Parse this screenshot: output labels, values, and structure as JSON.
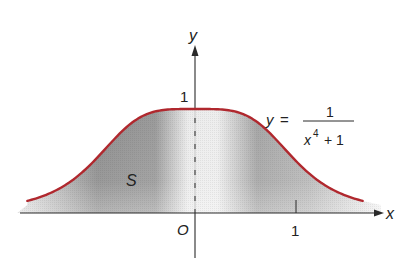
{
  "figure": {
    "type": "function-graph",
    "function": {
      "lhs": "y",
      "equals": "=",
      "numerator": "1",
      "denominator_base": "x",
      "denominator_exponent": "4",
      "denominator_rest": "+ 1",
      "curve_color": "#b0282e"
    },
    "region_label": "S",
    "axes": {
      "x_label": "x",
      "y_label": "y",
      "origin_label": "O",
      "x_tick_label": "1",
      "y_tick_label": "1"
    },
    "colors": {
      "curve": "#b0282e",
      "axis": "#2a2a2a",
      "shade_dark": "#8a8a8a",
      "shade_light": "#f0f0f0"
    }
  },
  "chart_data": {
    "type": "area",
    "title": "",
    "function": "y = 1/(x^4 + 1)",
    "xlabel": "x",
    "ylabel": "y",
    "x_ticks": [
      1
    ],
    "y_ticks": [
      1
    ],
    "origin_label": "O",
    "shaded_region_label": "S",
    "x": [
      -1.66,
      -1.5,
      -1.25,
      -1.0,
      -0.75,
      -0.5,
      -0.25,
      0,
      0.25,
      0.5,
      0.75,
      1.0,
      1.25,
      1.5,
      1.66
    ],
    "values": [
      0.117,
      0.165,
      0.291,
      0.5,
      0.76,
      0.941,
      0.996,
      1.0,
      0.996,
      0.941,
      0.76,
      0.5,
      0.291,
      0.165,
      0.117
    ],
    "xlim": [
      -1.7,
      1.9
    ],
    "ylim": [
      -0.45,
      1.7
    ],
    "grid": false,
    "legend": "none"
  }
}
